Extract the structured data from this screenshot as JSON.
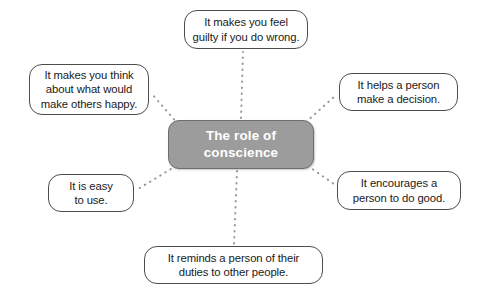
{
  "diagram": {
    "type": "mind-map",
    "center": {
      "label": "The role of\nconscience",
      "fill_color": "#9c9c9c",
      "text_color": "#ffffff"
    },
    "connector_color": "#999999",
    "connector_style": "dotted",
    "branches": [
      {
        "id": "top",
        "label": "It makes you feel\nguilty if you do wrong.",
        "position": "top"
      },
      {
        "id": "left",
        "label": "It makes you think\nabout what would\nmake others happy.",
        "position": "upper-left"
      },
      {
        "id": "right",
        "label": "It helps a person\nmake a decision.",
        "position": "upper-right"
      },
      {
        "id": "lower-left",
        "label": "It is easy\nto use.",
        "position": "lower-left"
      },
      {
        "id": "lower-right",
        "label": "It encourages a\nperson to do good.",
        "position": "lower-right"
      },
      {
        "id": "bottom",
        "label": "It reminds a person of their\nduties to other people.",
        "position": "bottom"
      }
    ]
  }
}
